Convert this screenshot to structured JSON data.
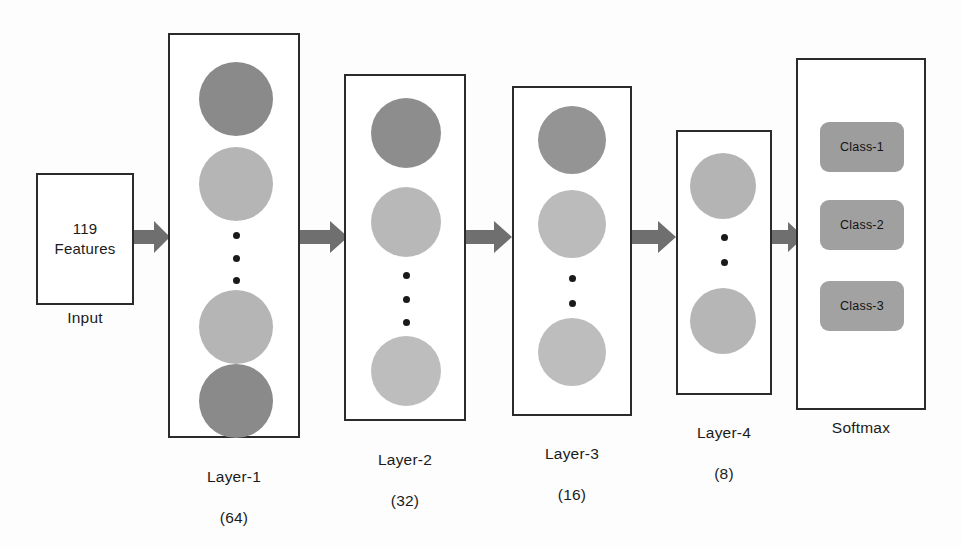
{
  "diagram": {
    "type": "neural-network-architecture"
  },
  "input": {
    "label_line1": "119",
    "label_line2": "Features",
    "caption": "Input"
  },
  "layers": [
    {
      "id": "layer-1",
      "caption_name": "Layer-1",
      "caption_count": "(64)",
      "units": 64,
      "neuron_shades": [
        "#8a8a8a",
        "#b5b5b5",
        "#b5b5b5",
        "#8a8a8a"
      ],
      "dot_count": 3
    },
    {
      "id": "layer-2",
      "caption_name": "Layer-2",
      "caption_count": "(32)",
      "units": 32,
      "neuron_shades": [
        "#8d8d8d",
        "#b8b8b8",
        "#bdbdbd"
      ],
      "dot_count": 3
    },
    {
      "id": "layer-3",
      "caption_name": "Layer-3",
      "caption_count": "(16)",
      "units": 16,
      "neuron_shades": [
        "#949494",
        "#bbbbbb",
        "#bdbdbd"
      ],
      "dot_count": 2
    },
    {
      "id": "layer-4",
      "caption_name": "Layer-4",
      "caption_count": "(8)",
      "units": 8,
      "neuron_shades": [
        "#b4b4b4",
        "#b6b6b6"
      ],
      "dot_count": 2
    }
  ],
  "softmax": {
    "caption": "Softmax",
    "classes": [
      {
        "label": "Class-1",
        "fill": "#9d9d9d"
      },
      {
        "label": "Class-2",
        "fill": "#a0a0a0"
      },
      {
        "label": "Class-3",
        "fill": "#a2a2a2"
      }
    ]
  },
  "arrows": {
    "count": 5,
    "color": "#6f6f6f",
    "names": [
      "input-to-layer-1",
      "layer-1-to-layer-2",
      "layer-2-to-layer-3",
      "layer-3-to-layer-4",
      "layer-4-to-softmax"
    ]
  },
  "style": {
    "outline_color": "#2b2b2b",
    "background": "#fdfdfd",
    "text_color": "#1b1b1b"
  }
}
